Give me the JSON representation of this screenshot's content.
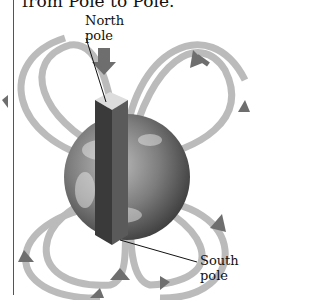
{
  "figure": {
    "caption_partial": "from Pole to Pole.",
    "labels": {
      "north": [
        "North",
        "pole"
      ],
      "south": [
        "South",
        "pole"
      ]
    },
    "colors": {
      "field_lines": "#9a9a9a",
      "arrows": "#6e6e6e",
      "earth": "#7a7a7a",
      "magnet": "#3a3a3a",
      "text": "#111111"
    }
  }
}
